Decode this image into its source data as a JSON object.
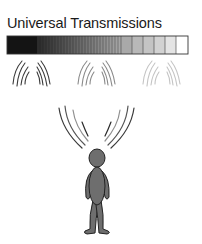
{
  "title": "Universal Transmissions",
  "spectrum_bar": {
    "description": "gradient bar from black (left) to white (right) made of vertical segments",
    "colors": [
      "#111111",
      "#7a7a7a",
      "#9a9a9a",
      "#b5b5b5",
      "#cfcfcf",
      "#e6e6e6",
      "#ffffff"
    ]
  },
  "wave_groups": [
    {
      "name": "dark",
      "color": "#333333"
    },
    {
      "name": "medium",
      "color": "#808080"
    },
    {
      "name": "light",
      "color": "#c0c0c0"
    }
  ],
  "figure": {
    "fill": "#6e6e6e",
    "stroke": "#222222"
  }
}
